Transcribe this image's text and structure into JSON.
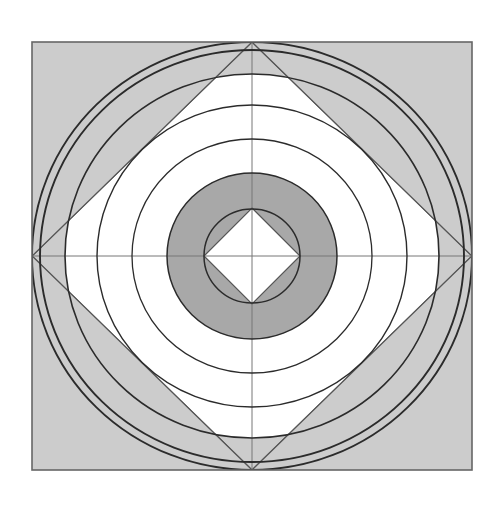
{
  "figure": {
    "canvas": {
      "width": 502,
      "height": 505,
      "background": "#ffffff"
    },
    "colors": {
      "background": "#ffffff",
      "light_gray_fill": "#cccccc",
      "dark_gray_fill": "#a8a8a8",
      "white_fill": "#ffffff",
      "stroke_dark": "#2b2b2b",
      "stroke_mid": "#555555",
      "stroke_thin": "#777777"
    },
    "frame": {
      "label": "outer square",
      "x": 32,
      "y": 42,
      "width": 440,
      "height": 428,
      "fill": "#cccccc",
      "stroke": "#666666",
      "stroke_width": 1.6
    },
    "center": {
      "x": 252,
      "y": 256
    },
    "diamond_outer": {
      "label": "large inscribed diamond",
      "vertices": "252,42 472,256 252,470 32,256",
      "fill": "none",
      "stroke": "#555555",
      "stroke_width": 1.2
    },
    "diamond_inner": {
      "label": "small central diamond",
      "vertices": "252,208 300,256 252,304 204,256",
      "fill": "#ffffff",
      "stroke": "#555555",
      "stroke_width": 1.2
    },
    "rings": [
      {
        "label": "ring-1-outermost",
        "rx": 220,
        "ry": 214,
        "fill": "none",
        "stroke": "#2b2b2b",
        "stroke_width": 1.9
      },
      {
        "label": "ring-2",
        "rx": 212,
        "ry": 206,
        "fill": "none",
        "stroke": "#2b2b2b",
        "stroke_width": 1.9
      },
      {
        "label": "ring-3",
        "rx": 187,
        "ry": 182,
        "fill": "none",
        "stroke": "#2b2b2b",
        "stroke_width": 1.6
      },
      {
        "label": "ring-4",
        "rx": 155,
        "ry": 151,
        "fill": "none",
        "stroke": "#2b2b2b",
        "stroke_width": 1.4
      },
      {
        "label": "ring-5",
        "rx": 120,
        "ry": 117,
        "fill": "none",
        "stroke": "#2b2b2b",
        "stroke_width": 1.3
      },
      {
        "label": "ring-6-dark-outer",
        "rx": 85,
        "ry": 83,
        "fill": "none",
        "stroke": "#2b2b2b",
        "stroke_width": 1.5
      },
      {
        "label": "ring-7-dark-inner",
        "rx": 48,
        "ry": 47,
        "fill": "none",
        "stroke": "#2b2b2b",
        "stroke_width": 1.5
      }
    ],
    "filled_bands": [
      {
        "label": "band-white-mid",
        "rx": 187,
        "ry": 182,
        "fill": "#ffffff"
      },
      {
        "label": "band-dark-annulus-outer",
        "rx": 85,
        "ry": 83,
        "fill": "#a8a8a8"
      },
      {
        "label": "band-white-core",
        "rx": 48,
        "ry": 47,
        "fill": "#ffffff"
      }
    ],
    "axes": {
      "horizontal": {
        "label": "horizontal center axis",
        "x1": 32,
        "y1": 256,
        "x2": 472,
        "y2": 256,
        "stroke": "#777777",
        "stroke_width": 1
      },
      "vertical": {
        "label": "vertical center axis",
        "x1": 252,
        "y1": 42,
        "x2": 252,
        "y2": 470,
        "stroke": "#777777",
        "stroke_width": 1
      }
    }
  }
}
